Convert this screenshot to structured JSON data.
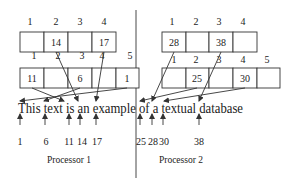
{
  "sentence": "This text is an example of a textual database",
  "processors": [
    {
      "label": "Processor 1",
      "top_array": {
        "indices": [
          "1",
          "2",
          "3",
          "4"
        ],
        "cells": [
          "",
          "14",
          "",
          "17"
        ]
      },
      "bottom_array": {
        "indices": [
          "1",
          "2",
          "3",
          "4",
          "5"
        ],
        "cells": [
          "11",
          "",
          "6",
          "",
          "1"
        ]
      },
      "positions": [
        "1",
        "6",
        "11",
        "14",
        "17"
      ]
    },
    {
      "label": "Processor 2",
      "top_array": {
        "indices": [
          "1",
          "2",
          "3",
          "4"
        ],
        "cells": [
          "28",
          "",
          "38",
          ""
        ]
      },
      "bottom_array": {
        "indices": [
          "1",
          "2",
          "3",
          "4",
          "5"
        ],
        "cells": [
          "",
          "25",
          "",
          "30",
          ""
        ]
      },
      "positions": [
        "25",
        "28",
        "30",
        "38"
      ]
    }
  ]
}
